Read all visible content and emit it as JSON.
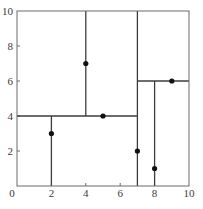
{
  "diagram": {
    "type": "kd-tree-partition",
    "xlim": [
      0,
      10
    ],
    "ylim": [
      0,
      10
    ],
    "x_ticks": [
      {
        "value": 0,
        "label": "0"
      },
      {
        "value": 2,
        "label": "2"
      },
      {
        "value": 4,
        "label": "4"
      },
      {
        "value": 6,
        "label": "6"
      },
      {
        "value": 8,
        "label": "8"
      },
      {
        "value": 10,
        "label": "10"
      }
    ],
    "y_ticks": [
      {
        "value": 2,
        "label": "2"
      },
      {
        "value": 4,
        "label": "4"
      },
      {
        "value": 6,
        "label": "6"
      },
      {
        "value": 8,
        "label": "8"
      },
      {
        "value": 10,
        "label": "10"
      }
    ],
    "points": [
      {
        "x": 2,
        "y": 3
      },
      {
        "x": 4,
        "y": 7
      },
      {
        "x": 5,
        "y": 4
      },
      {
        "x": 7,
        "y": 2
      },
      {
        "x": 8,
        "y": 1
      },
      {
        "x": 9,
        "y": 6
      }
    ],
    "splits": [
      {
        "orientation": "vertical",
        "x": 7,
        "y0": 0,
        "y1": 10
      },
      {
        "orientation": "horizontal",
        "y": 4,
        "x0": 0,
        "x1": 7
      },
      {
        "orientation": "vertical",
        "x": 2,
        "y0": 0,
        "y1": 4
      },
      {
        "orientation": "vertical",
        "x": 4,
        "y0": 4,
        "y1": 10
      },
      {
        "orientation": "horizontal",
        "y": 6,
        "x0": 7,
        "x1": 10
      },
      {
        "orientation": "vertical",
        "x": 8,
        "y0": 0,
        "y1": 6
      }
    ],
    "colors": {
      "frame": "#6a6a6a",
      "split": "#3c3c3c",
      "point": "#111111",
      "label": "#3a3a3a"
    }
  }
}
